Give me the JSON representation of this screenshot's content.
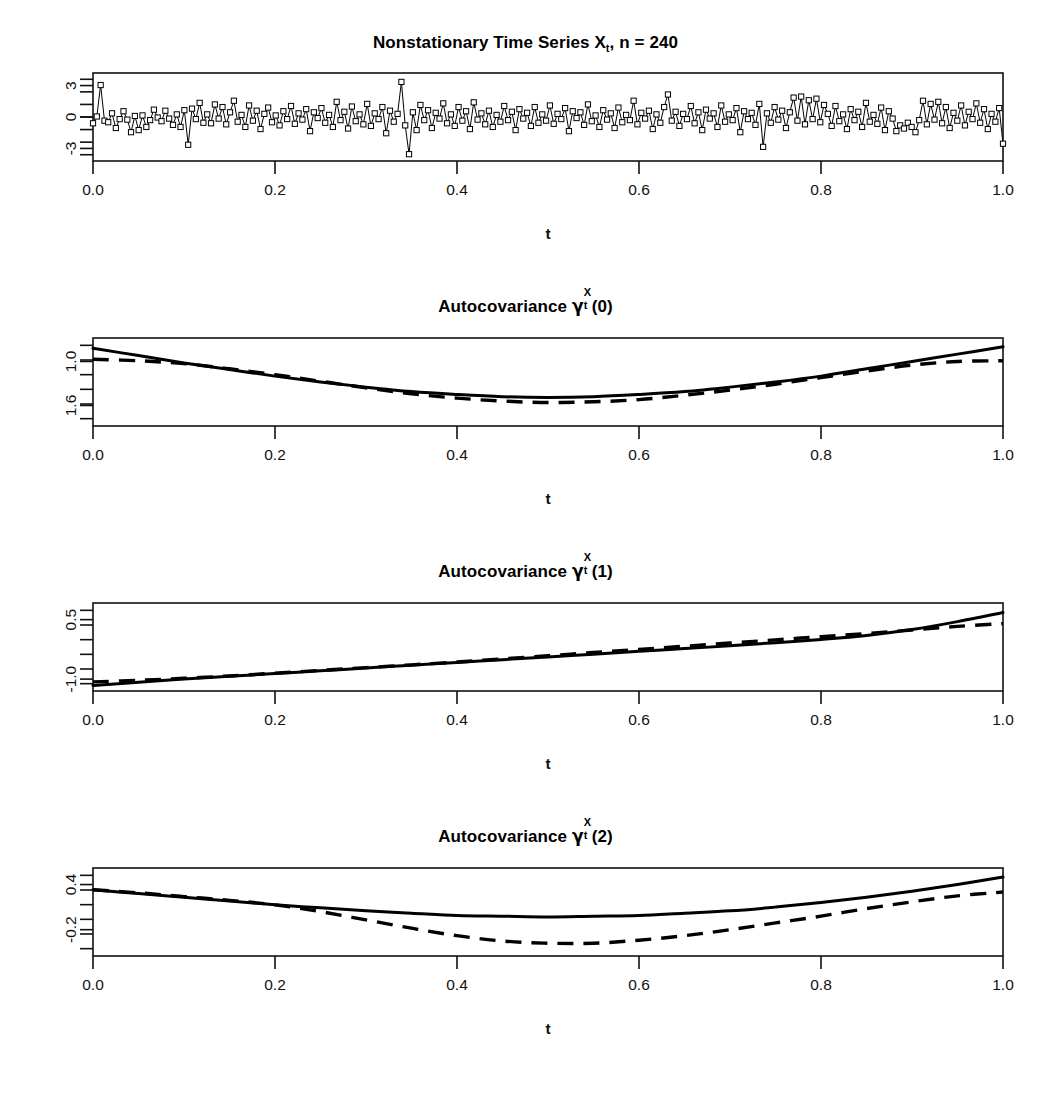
{
  "figure": {
    "width": 1051,
    "height": 1095,
    "background": "#ffffff",
    "foreground": "#000000",
    "panel_count": 4
  },
  "panels": [
    {
      "id": "time-series",
      "title_prefix": "Nonstationary Time Series X",
      "title_sub": "t",
      "title_suffix": ",  n = 240",
      "xlabel": "t",
      "x_ticks": [
        "0.0",
        "0.2",
        "0.4",
        "0.6",
        "0.8",
        "1.0"
      ],
      "y_ticks": [
        "3",
        "0",
        "-3"
      ]
    },
    {
      "id": "autocovariance-lag-0",
      "title_prefix": "Autocovariance ",
      "title_gamma": "γ",
      "title_sup": "X",
      "title_sub": "t",
      "title_suffix": "(0)",
      "xlabel": "t",
      "x_ticks": [
        "0.0",
        "0.2",
        "0.4",
        "0.6",
        "0.8",
        "1.0"
      ],
      "y_ticks": [
        "1.6",
        "1.0"
      ]
    },
    {
      "id": "autocovariance-lag-1",
      "title_prefix": "Autocovariance ",
      "title_gamma": "γ",
      "title_sup": "X",
      "title_sub": "t",
      "title_suffix": "(1)",
      "xlabel": "t",
      "x_ticks": [
        "0.0",
        "0.2",
        "0.4",
        "0.6",
        "0.8",
        "1.0"
      ],
      "y_ticks": [
        "0.5",
        "-1.0"
      ]
    },
    {
      "id": "autocovariance-lag-2",
      "title_prefix": "Autocovariance ",
      "title_gamma": "γ",
      "title_sup": "X",
      "title_sub": "t",
      "title_suffix": "(2)",
      "xlabel": "t",
      "x_ticks": [
        "0.0",
        "0.2",
        "0.4",
        "0.6",
        "0.8",
        "1.0"
      ],
      "y_ticks": [
        "0.4",
        "-0.2"
      ]
    }
  ],
  "chart_data": [
    {
      "type": "line",
      "id": "time-series",
      "title": "Nonstationary Time Series X_t,  n = 240",
      "xlabel": "t",
      "ylabel": "",
      "xlim": [
        0.0,
        1.0
      ],
      "ylim": [
        -4.2,
        4.2
      ],
      "xticks": [
        0.0,
        0.2,
        0.4,
        0.6,
        0.8,
        1.0
      ],
      "yticks": [
        3,
        0,
        -3
      ],
      "grid": false,
      "legend": "none",
      "marker": "open-square",
      "n": 240,
      "x": [
        0.0,
        0.0042,
        0.0084,
        0.0126,
        0.0167,
        0.0209,
        0.0251,
        0.0293,
        0.0335,
        0.0377,
        0.0418,
        0.046,
        0.0502,
        0.0544,
        0.0586,
        0.0628,
        0.0669,
        0.0711,
        0.0753,
        0.0795,
        0.0837,
        0.0879,
        0.0921,
        0.0962,
        0.1004,
        0.1046,
        0.1088,
        0.113,
        0.1172,
        0.1213,
        0.1255,
        0.1297,
        0.1339,
        0.1381,
        0.1423,
        0.1464,
        0.1506,
        0.1548,
        0.159,
        0.1632,
        0.1674,
        0.1715,
        0.1757,
        0.1799,
        0.1841,
        0.1883,
        0.1925,
        0.1967,
        0.2008,
        0.205,
        0.2092,
        0.2134,
        0.2176,
        0.2218,
        0.2259,
        0.2301,
        0.2343,
        0.2385,
        0.2427,
        0.2469,
        0.251,
        0.2552,
        0.2594,
        0.2636,
        0.2678,
        0.272,
        0.2762,
        0.2803,
        0.2845,
        0.2887,
        0.2929,
        0.2971,
        0.3013,
        0.3054,
        0.3096,
        0.3138,
        0.318,
        0.3222,
        0.3264,
        0.3305,
        0.3347,
        0.3389,
        0.3431,
        0.3473,
        0.3515,
        0.3556,
        0.3598,
        0.364,
        0.3682,
        0.3724,
        0.3766,
        0.3808,
        0.3849,
        0.3891,
        0.3933,
        0.3975,
        0.4017,
        0.4059,
        0.41,
        0.4142,
        0.4184,
        0.4226,
        0.4268,
        0.431,
        0.4351,
        0.4393,
        0.4435,
        0.4477,
        0.4519,
        0.4561,
        0.4603,
        0.4644,
        0.4686,
        0.4728,
        0.477,
        0.4812,
        0.4854,
        0.4895,
        0.4937,
        0.4979,
        0.5021,
        0.5063,
        0.5105,
        0.5146,
        0.5188,
        0.523,
        0.5272,
        0.5314,
        0.5356,
        0.5397,
        0.5439,
        0.5481,
        0.5523,
        0.5565,
        0.5607,
        0.5649,
        0.569,
        0.5732,
        0.5774,
        0.5816,
        0.5858,
        0.59,
        0.5941,
        0.5983,
        0.6025,
        0.6067,
        0.6109,
        0.6151,
        0.6192,
        0.6234,
        0.6276,
        0.6318,
        0.636,
        0.6402,
        0.6444,
        0.6485,
        0.6527,
        0.6569,
        0.6611,
        0.6653,
        0.6695,
        0.6736,
        0.6778,
        0.682,
        0.6862,
        0.6904,
        0.6946,
        0.6987,
        0.7029,
        0.7071,
        0.7113,
        0.7155,
        0.7197,
        0.7238,
        0.728,
        0.7322,
        0.7364,
        0.7406,
        0.7448,
        0.749,
        0.7531,
        0.7573,
        0.7615,
        0.7657,
        0.7699,
        0.7741,
        0.7782,
        0.7824,
        0.7866,
        0.7908,
        0.795,
        0.7992,
        0.8033,
        0.8075,
        0.8117,
        0.8159,
        0.8201,
        0.8243,
        0.8285,
        0.8326,
        0.8368,
        0.841,
        0.8452,
        0.8494,
        0.8536,
        0.8577,
        0.8619,
        0.8661,
        0.8703,
        0.8745,
        0.8787,
        0.8828,
        0.887,
        0.8912,
        0.8954,
        0.8996,
        0.9038,
        0.9079,
        0.9121,
        0.9163,
        0.9205,
        0.9247,
        0.9289,
        0.9331,
        0.9372,
        0.9414,
        0.9456,
        0.9498,
        0.954,
        0.9582,
        0.9623,
        0.9665,
        0.9707,
        0.9749,
        0.9791,
        0.9833,
        0.9874,
        0.9916,
        0.9958,
        1.0
      ],
      "y": [
        -0.6,
        0.05,
        3.05,
        -0.35,
        -0.5,
        0.35,
        -1.05,
        -0.2,
        0.55,
        -0.25,
        -1.45,
        0.1,
        -1.25,
        0.15,
        -0.95,
        -0.3,
        0.7,
        -0.05,
        -0.4,
        0.6,
        -0.15,
        -0.75,
        0.25,
        -0.95,
        0.65,
        -2.65,
        0.8,
        -0.2,
        1.35,
        -0.55,
        0.25,
        -0.6,
        1.2,
        -0.15,
        0.95,
        -0.7,
        0.45,
        1.55,
        -0.45,
        0.2,
        -0.95,
        1.1,
        -0.35,
        0.6,
        -1.15,
        0.3,
        0.9,
        -0.5,
        0.15,
        -0.8,
        0.55,
        -0.2,
        1.05,
        -0.65,
        0.35,
        -0.25,
        0.75,
        -1.35,
        0.45,
        -0.1,
        0.85,
        -0.55,
        0.2,
        -0.95,
        1.45,
        -0.3,
        0.5,
        -1.1,
        1.0,
        -0.4,
        0.25,
        -0.7,
        1.25,
        -0.85,
        0.35,
        -0.2,
        0.95,
        -1.55,
        0.6,
        -0.45,
        0.3,
        3.35,
        -0.8,
        -3.55,
        0.45,
        -1.25,
        1.15,
        -0.3,
        0.65,
        -1.05,
        0.4,
        -0.15,
        1.3,
        -0.6,
        0.25,
        -0.85,
        0.95,
        -0.35,
        0.55,
        -1.15,
        1.4,
        -0.25,
        0.35,
        -0.7,
        0.6,
        -0.95,
        0.2,
        -0.45,
        1.05,
        -0.3,
        0.5,
        -1.25,
        0.75,
        -0.15,
        0.4,
        -0.85,
        0.95,
        -0.55,
        0.25,
        -0.35,
        1.1,
        -0.65,
        0.3,
        -0.2,
        0.85,
        -1.35,
        0.55,
        -0.1,
        0.45,
        -0.75,
        1.2,
        -0.4,
        0.15,
        -0.95,
        0.65,
        -0.25,
        0.35,
        -1.05,
        0.9,
        -0.5,
        0.2,
        -0.3,
        1.55,
        -0.7,
        0.4,
        -0.15,
        0.6,
        -1.15,
        0.25,
        -0.55,
        0.95,
        2.15,
        -0.35,
        0.5,
        -0.85,
        0.3,
        -0.2,
        1.05,
        -0.6,
        0.45,
        -1.25,
        0.7,
        -0.15,
        0.35,
        -0.95,
        1.1,
        -0.45,
        0.25,
        -0.3,
        0.85,
        -1.45,
        0.55,
        -0.2,
        0.4,
        -0.75,
        1.25,
        -2.85,
        0.35,
        -0.55,
        0.95,
        -0.25,
        0.6,
        -1.05,
        0.45,
        1.85,
        -0.35,
        1.95,
        -0.7,
        1.6,
        -0.2,
        1.75,
        -0.5,
        1.15,
        0.3,
        -0.85,
        1.05,
        -0.4,
        0.25,
        -1.15,
        0.75,
        -0.3,
        0.5,
        -0.95,
        1.35,
        -0.45,
        0.2,
        -0.65,
        0.9,
        -1.25,
        0.55,
        -0.15,
        -1.35,
        -0.8,
        -1.1,
        -0.55,
        -0.95,
        -1.45,
        -0.3,
        1.55,
        -0.7,
        1.25,
        -0.25,
        1.45,
        -0.6,
        0.95,
        -1.05,
        0.4,
        -0.35,
        1.1,
        -0.8,
        0.5,
        -0.2,
        1.3,
        -0.55,
        0.75,
        -1.15,
        0.3,
        -0.45,
        0.85,
        -2.55,
        -0.35,
        -2.95,
        0.45,
        -0.25,
        -0.55,
        0.35
      ]
    },
    {
      "type": "line",
      "id": "autocovariance-lag-0",
      "title": "Autocovariance gamma_t^X(0)",
      "xlabel": "t",
      "ylabel": "",
      "xlim": [
        0.0,
        1.0
      ],
      "ylim": [
        0.72,
        1.92
      ],
      "xticks": [
        0.0,
        0.2,
        0.4,
        0.6,
        0.8,
        1.0
      ],
      "yticks": [
        1.0,
        1.6
      ],
      "grid": false,
      "legend": "none",
      "series": [
        {
          "name": "true",
          "style": "solid",
          "x": [
            0.0,
            0.05,
            0.1,
            0.15,
            0.2,
            0.25,
            0.3,
            0.35,
            0.4,
            0.45,
            0.5,
            0.55,
            0.6,
            0.65,
            0.7,
            0.75,
            0.8,
            0.85,
            0.9,
            0.95,
            1.0
          ],
          "values": [
            1.78,
            1.68,
            1.58,
            1.49,
            1.4,
            1.32,
            1.25,
            1.19,
            1.15,
            1.12,
            1.11,
            1.12,
            1.15,
            1.19,
            1.25,
            1.32,
            1.4,
            1.5,
            1.6,
            1.7,
            1.8
          ]
        },
        {
          "name": "estimate",
          "style": "dashed",
          "x": [
            0.0,
            0.05,
            0.1,
            0.15,
            0.2,
            0.25,
            0.3,
            0.35,
            0.4,
            0.45,
            0.5,
            0.55,
            0.6,
            0.65,
            0.7,
            0.75,
            0.8,
            0.85,
            0.9,
            0.95,
            1.0
          ],
          "values": [
            1.63,
            1.61,
            1.57,
            1.5,
            1.42,
            1.33,
            1.24,
            1.16,
            1.1,
            1.06,
            1.04,
            1.05,
            1.08,
            1.14,
            1.21,
            1.29,
            1.38,
            1.47,
            1.55,
            1.6,
            1.61
          ]
        }
      ]
    },
    {
      "type": "line",
      "id": "autocovariance-lag-1",
      "title": "Autocovariance gamma_t^X(1)",
      "xlabel": "t",
      "ylabel": "",
      "xlim": [
        0.0,
        1.0
      ],
      "ylim": [
        -1.3,
        0.92
      ],
      "xticks": [
        0.0,
        0.2,
        0.4,
        0.6,
        0.8,
        1.0
      ],
      "yticks": [
        0.5,
        -1.0
      ],
      "grid": false,
      "legend": "none",
      "series": [
        {
          "name": "true",
          "style": "solid",
          "x": [
            0.0,
            0.05,
            0.1,
            0.15,
            0.2,
            0.25,
            0.3,
            0.35,
            0.4,
            0.45,
            0.5,
            0.55,
            0.6,
            0.65,
            0.7,
            0.75,
            0.8,
            0.85,
            0.9,
            0.95,
            1.0
          ],
          "values": [
            -1.16,
            -1.08,
            -1.0,
            -0.93,
            -0.86,
            -0.79,
            -0.72,
            -0.65,
            -0.58,
            -0.51,
            -0.44,
            -0.37,
            -0.3,
            -0.23,
            -0.16,
            -0.08,
            0.0,
            0.1,
            0.25,
            0.45,
            0.68
          ]
        },
        {
          "name": "estimate",
          "style": "dashed",
          "x": [
            0.0,
            0.05,
            0.1,
            0.15,
            0.2,
            0.25,
            0.3,
            0.35,
            0.4,
            0.45,
            0.5,
            0.55,
            0.6,
            0.65,
            0.7,
            0.75,
            0.8,
            0.85,
            0.9,
            0.95,
            1.0
          ],
          "values": [
            -1.07,
            -1.03,
            -0.98,
            -0.92,
            -0.85,
            -0.78,
            -0.71,
            -0.64,
            -0.57,
            -0.49,
            -0.41,
            -0.33,
            -0.25,
            -0.17,
            -0.09,
            -0.01,
            0.07,
            0.15,
            0.24,
            0.33,
            0.4
          ]
        }
      ]
    },
    {
      "type": "line",
      "id": "autocovariance-lag-2",
      "title": "Autocovariance gamma_t^X(2)",
      "xlabel": "t",
      "ylabel": "",
      "xlim": [
        0.0,
        1.0
      ],
      "ylim": [
        -0.55,
        0.62
      ],
      "xticks": [
        0.0,
        0.2,
        0.4,
        0.6,
        0.8,
        1.0
      ],
      "yticks": [
        0.4,
        -0.2
      ],
      "grid": false,
      "legend": "none",
      "series": [
        {
          "name": "true",
          "style": "solid",
          "x": [
            0.0,
            0.05,
            0.1,
            0.15,
            0.2,
            0.25,
            0.3,
            0.35,
            0.4,
            0.45,
            0.5,
            0.55,
            0.6,
            0.65,
            0.7,
            0.75,
            0.8,
            0.85,
            0.9,
            0.95,
            1.0
          ],
          "values": [
            0.33,
            0.28,
            0.23,
            0.18,
            0.13,
            0.09,
            0.05,
            0.02,
            -0.01,
            -0.02,
            -0.03,
            -0.02,
            -0.01,
            0.02,
            0.05,
            0.1,
            0.16,
            0.23,
            0.31,
            0.4,
            0.5
          ]
        },
        {
          "name": "estimate",
          "style": "dashed",
          "x": [
            0.0,
            0.05,
            0.1,
            0.15,
            0.2,
            0.25,
            0.3,
            0.35,
            0.4,
            0.45,
            0.5,
            0.55,
            0.6,
            0.65,
            0.7,
            0.75,
            0.8,
            0.85,
            0.9,
            0.95,
            1.0
          ],
          "values": [
            0.33,
            0.29,
            0.24,
            0.19,
            0.13,
            0.04,
            -0.07,
            -0.18,
            -0.28,
            -0.35,
            -0.38,
            -0.38,
            -0.34,
            -0.28,
            -0.2,
            -0.11,
            -0.02,
            0.08,
            0.17,
            0.25,
            0.3
          ]
        }
      ]
    }
  ]
}
